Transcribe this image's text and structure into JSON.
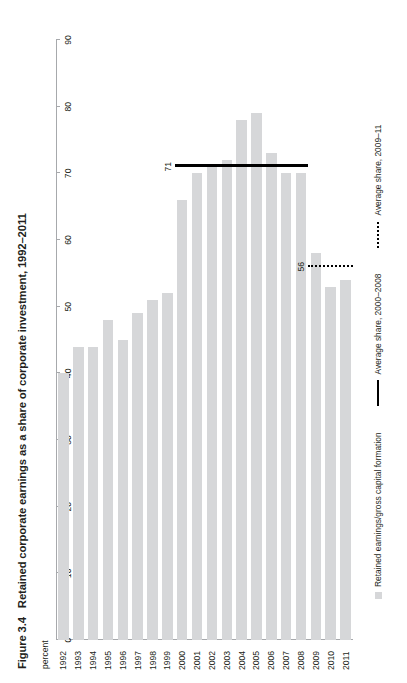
{
  "figure": {
    "number": "Figure 3.4",
    "title": "Retained corporate earnings as a share of corporate investment, 1992–2011",
    "axis_unit": "percent"
  },
  "legend": {
    "items": [
      {
        "marker": "swatch",
        "label": "Retained earnings/gross capital formation"
      },
      {
        "marker": "solid-line",
        "label": "Average share, 2000–2008"
      },
      {
        "marker": "dotted-line",
        "label": "Average share, 2009–11"
      }
    ]
  },
  "annotations": [
    {
      "name": "avg-2000-2008",
      "value": 71,
      "label": "71",
      "style": "solid"
    },
    {
      "name": "avg-2009-11",
      "value": 56,
      "label": "56",
      "style": "dotted"
    }
  ],
  "chart_data": {
    "type": "bar",
    "orientation": "horizontal",
    "title": "Retained corporate earnings as a share of corporate investment, 1992–2011",
    "xlabel": "percent",
    "ylabel": "",
    "xlim": [
      0,
      90
    ],
    "xticks": [
      0,
      10,
      20,
      30,
      40,
      50,
      60,
      70,
      80,
      90
    ],
    "grid": false,
    "legend_position": "bottom",
    "categories": [
      "1992",
      "1993",
      "1994",
      "1995",
      "1996",
      "1997",
      "1998",
      "1999",
      "2000",
      "2001",
      "2002",
      "2003",
      "2004",
      "2005",
      "2006",
      "2007",
      "2008",
      "2009",
      "2010",
      "2011"
    ],
    "values": [
      40,
      44,
      44,
      48,
      45,
      49,
      51,
      52,
      66,
      70,
      71,
      72,
      78,
      79,
      73,
      70,
      70,
      58,
      53,
      54
    ],
    "series": [
      {
        "name": "Retained earnings/gross capital formation",
        "values": [
          40,
          44,
          44,
          48,
          45,
          49,
          51,
          52,
          66,
          70,
          71,
          72,
          78,
          79,
          73,
          70,
          70,
          58,
          53,
          54
        ]
      }
    ],
    "reference_lines": [
      {
        "label": "Average share, 2000–2008",
        "value": 71,
        "style": "solid",
        "spans": [
          "2000",
          "2008"
        ],
        "data_label": "71"
      },
      {
        "label": "Average share, 2009–11",
        "value": 56,
        "style": "dotted",
        "spans": [
          "2009",
          "2011"
        ],
        "data_label": "56"
      }
    ]
  }
}
